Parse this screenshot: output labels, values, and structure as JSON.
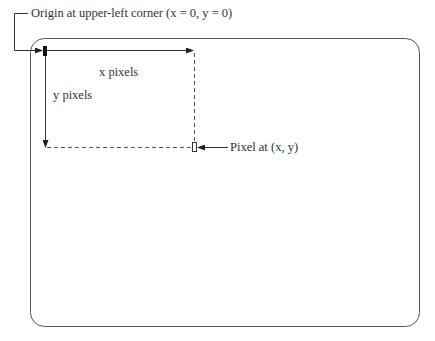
{
  "diagram": {
    "type": "screen-coordinate-system",
    "labels": {
      "origin": "Origin at upper-left corner (x = 0, y = 0)",
      "x_axis": "x pixels",
      "y_axis": "y pixels",
      "pixel": "Pixel at (x, y)"
    },
    "colors": {
      "stroke": "#333333",
      "frame": "#555555",
      "background": "#ffffff"
    }
  }
}
